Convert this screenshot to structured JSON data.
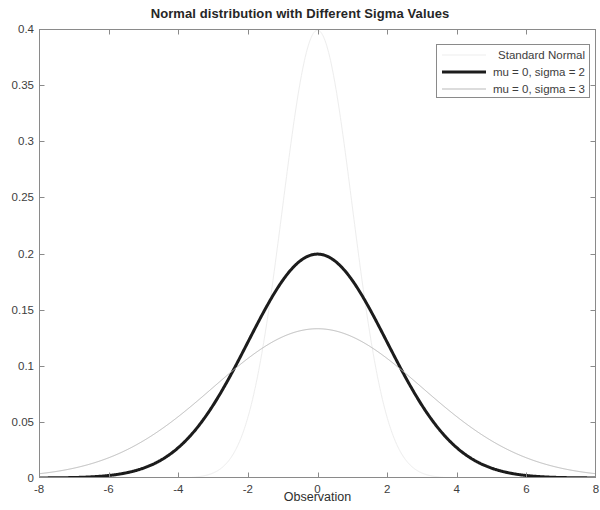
{
  "chart_data": {
    "type": "line",
    "title": "Normal distribution with Different Sigma Values",
    "xlabel": "Observation",
    "ylabel": "",
    "xlim": [
      -8,
      8
    ],
    "ylim": [
      0,
      0.4
    ],
    "xticks": [
      "-8",
      "-6",
      "-4",
      "-2",
      "0",
      "2",
      "4",
      "6",
      "8"
    ],
    "xtick_values": [
      -8,
      -6,
      -4,
      -2,
      0,
      2,
      4,
      6,
      8
    ],
    "yticks": [
      "0",
      "0.05",
      "0.1",
      "0.15",
      "0.2",
      "0.25",
      "0.3",
      "0.35",
      "0.4"
    ],
    "ytick_values": [
      0,
      0.05,
      0.1,
      0.15,
      0.2,
      0.25,
      0.3,
      0.35,
      0.4
    ],
    "grid": false,
    "legend_position": "top right",
    "series": [
      {
        "name": "Standard Normal",
        "mu": 0,
        "sigma": 1,
        "color": "#ededed",
        "width": 1,
        "peak": 0.39894,
        "x": [
          -8,
          -7.5,
          -7,
          -6.5,
          -6,
          -5.5,
          -5,
          -4.5,
          -4,
          -3.5,
          -3,
          -2.5,
          -2,
          -1.5,
          -1,
          -0.5,
          0,
          0.5,
          1,
          1.5,
          2,
          2.5,
          3,
          3.5,
          4,
          4.5,
          5,
          5.5,
          6,
          6.5,
          7,
          7.5,
          8
        ],
        "values": [
          0.0,
          0.0,
          0.0,
          0.0,
          0.0,
          0.0,
          0.0,
          0.0,
          0.0001,
          0.0009,
          0.0044,
          0.0175,
          0.054,
          0.1295,
          0.242,
          0.3521,
          0.3989,
          0.3521,
          0.242,
          0.1295,
          0.054,
          0.0175,
          0.0044,
          0.0009,
          0.0001,
          0.0,
          0.0,
          0.0,
          0.0,
          0.0,
          0.0,
          0.0,
          0.0
        ]
      },
      {
        "name": "mu = 0, sigma = 2",
        "mu": 0,
        "sigma": 2,
        "color": "#1c1c1c",
        "width": 3,
        "peak": 0.19947,
        "x": [
          -8,
          -7.5,
          -7,
          -6.5,
          -6,
          -5.5,
          -5,
          -4.5,
          -4,
          -3.5,
          -3,
          -2.5,
          -2,
          -1.5,
          -1,
          -0.5,
          0,
          0.5,
          1,
          1.5,
          2,
          2.5,
          3,
          3.5,
          4,
          4.5,
          5,
          5.5,
          6,
          6.5,
          7,
          7.5,
          8
        ],
        "values": [
          0.0003,
          0.0009,
          0.0022,
          0.0049,
          0.0099,
          0.0184,
          0.0315,
          0.0497,
          0.072,
          0.096,
          0.1175,
          0.1324,
          0.176,
          0.1826,
          0.176,
          0.1933,
          0.1995,
          0.1933,
          0.176,
          0.1505,
          0.121,
          0.0913,
          0.0648,
          0.0432,
          0.027,
          0.0158,
          0.0088,
          0.0045,
          0.0022,
          0.001,
          0.0004,
          0.0002,
          0.0001
        ]
      },
      {
        "name": "mu = 0, sigma = 3",
        "mu": 0,
        "sigma": 3,
        "color": "#b9b9b9",
        "width": 1,
        "peak": 0.13298,
        "x": [
          -8,
          -7.5,
          -7,
          -6.5,
          -6,
          -5.5,
          -5,
          -4.5,
          -4,
          -3.5,
          -3,
          -2.5,
          -2,
          -1.5,
          -1,
          -0.5,
          0,
          0.5,
          1,
          1.5,
          2,
          2.5,
          3,
          3.5,
          4,
          4.5,
          5,
          5.5,
          6,
          6.5,
          7,
          7.5,
          8
        ],
        "values": [
          0.0055,
          0.0079,
          0.0108,
          0.0145,
          0.018,
          0.0229,
          0.0283,
          0.0342,
          0.0403,
          0.0465,
          0.0538,
          0.0612,
          0.0684,
          0.0788,
          0.0856,
          0.0911,
          0.133,
          0.0911,
          0.0856,
          0.0788,
          0.0684,
          0.0612,
          0.0538,
          0.0465,
          0.0403,
          0.0342,
          0.0283,
          0.0229,
          0.018,
          0.0145,
          0.0108,
          0.0079,
          0.0055
        ]
      }
    ]
  },
  "header": {
    "title": "Normal distribution with Different Sigma Values"
  },
  "axes": {
    "xlabel": "Observation",
    "xticks": [
      "-8",
      "-6",
      "-4",
      "-2",
      "0",
      "2",
      "4",
      "6",
      "8"
    ],
    "yticks": [
      "0",
      "0.05",
      "0.1",
      "0.15",
      "0.2",
      "0.25",
      "0.3",
      "0.35",
      "0.4"
    ],
    "axis_color": "#8a8a8a",
    "tick_color": "#3d3d3d"
  },
  "legend": {
    "entries": [
      {
        "label": "Standard Normal",
        "swatch": "line-light"
      },
      {
        "label": "mu = 0, sigma = 2",
        "swatch": "line-thick-black"
      },
      {
        "label": "mu = 0, sigma = 3",
        "swatch": "line-gray"
      }
    ]
  }
}
